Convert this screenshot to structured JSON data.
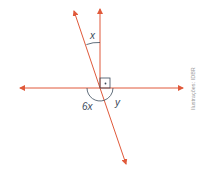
{
  "diagram": {
    "type": "geometry-angles",
    "line_color": "#e0593a",
    "arc_color": "#3a4a5a",
    "labels": {
      "angle_top": "x",
      "angle_bottom_left": "6x",
      "angle_bottom_right": "y"
    },
    "right_angle_marker": "·",
    "credit": "Ilustrações: IDBR"
  }
}
